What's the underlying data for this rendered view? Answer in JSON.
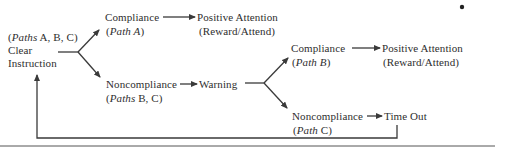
{
  "diagram": {
    "start": {
      "paths_label_prefix": "(",
      "paths_label_italic": "Paths",
      "paths_label_rest": " A, B, C)",
      "line1": "Clear",
      "line2": "Instruction"
    },
    "compliance_a": {
      "label": "Compliance",
      "path_open": "(",
      "path_italic": "Path A",
      "path_close": ")"
    },
    "positive_a": {
      "label": "Positive Attention",
      "sub": "(Reward/Attend)"
    },
    "noncompliance_bc": {
      "label": "Noncompliance",
      "path_open": "(",
      "path_italic": "Paths",
      "path_rest": " B, C)"
    },
    "warning": {
      "label": "Warning"
    },
    "compliance_b": {
      "label": "Compliance",
      "path_open": "(",
      "path_italic": "Path B",
      "path_close": ")"
    },
    "positive_b": {
      "label": "Positive Attention",
      "sub": "(Reward/Attend)"
    },
    "noncompliance_c": {
      "label": "Noncompliance",
      "path_open": "(",
      "path_italic": "Path",
      "path_rest": " C)"
    },
    "timeout": {
      "label": "Time Out"
    },
    "colors": {
      "line": "#3a3a3a",
      "text": "#2e2e2e",
      "background": "#ffffff"
    }
  }
}
